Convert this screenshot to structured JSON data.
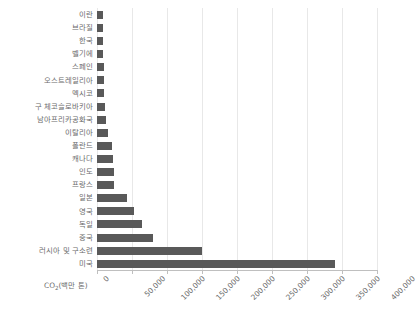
{
  "chart_data": {
    "type": "bar",
    "orientation": "horizontal",
    "title": "",
    "xlabel": "CO2(백만 톤)",
    "xlabel_parts": {
      "pre": "CO",
      "sub": "2",
      "post": "(백만 톤)"
    },
    "ylabel": "",
    "xlim": [
      0,
      400000
    ],
    "xticks": [
      0,
      50000,
      100000,
      150000,
      200000,
      250000,
      300000,
      350000,
      400000
    ],
    "xtick_labels": [
      "0",
      "50,000",
      "100,000",
      "150,000",
      "200,000",
      "250,000",
      "300,000",
      "350,000",
      "400,000"
    ],
    "grid": true,
    "grid_axis": "x",
    "legend": false,
    "bar_color": "#595959",
    "gridline_color": "#e8e8e8",
    "axis_color": "#bfbfbf",
    "text_color": "#6b6b6b",
    "categories": [
      "이란",
      "브라질",
      "한국",
      "벨기에",
      "스페인",
      "오스트레일리아",
      "멕시코",
      "구 체코슬로바키아",
      "남아프리카공화국",
      "이탈리아",
      "폴란드",
      "캐나다",
      "인도",
      "프랑스",
      "일본",
      "영국",
      "독일",
      "중국",
      "러시아 및 구소련",
      "미국"
    ],
    "values": [
      8000,
      8500,
      8500,
      9000,
      9500,
      10000,
      10500,
      12000,
      12500,
      16000,
      21000,
      23000,
      24000,
      24000,
      43000,
      53000,
      64000,
      80000,
      150000,
      340000
    ]
  }
}
